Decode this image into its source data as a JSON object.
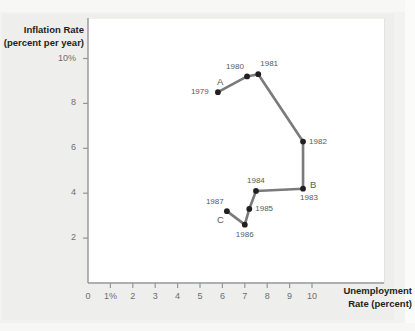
{
  "chart_data": {
    "type": "line",
    "title": "",
    "subtitle": "",
    "xlabel": "Unemployment Rate (percent)",
    "ylabel": "Inflation Rate (percent per year)",
    "xlabel_line1": "Unemployment",
    "xlabel_line2": "Rate (percent)",
    "ylabel_line1": "Inflation Rate",
    "ylabel_line2": "(percent per year)",
    "xlim": [
      0,
      10.6
    ],
    "ylim": [
      0,
      10.6
    ],
    "grid": false,
    "legend": "none",
    "xticks": [
      {
        "value": 0,
        "label": "0"
      },
      {
        "value": 1,
        "label": "1%"
      },
      {
        "value": 2,
        "label": "2"
      },
      {
        "value": 3,
        "label": "3"
      },
      {
        "value": 4,
        "label": "4"
      },
      {
        "value": 5,
        "label": "5"
      },
      {
        "value": 6,
        "label": "6"
      },
      {
        "value": 7,
        "label": "7"
      },
      {
        "value": 8,
        "label": "8"
      },
      {
        "value": 9,
        "label": "9"
      },
      {
        "value": 10,
        "label": "10"
      }
    ],
    "yticks": [
      {
        "value": 10,
        "label": "10%"
      },
      {
        "value": 8,
        "label": "8"
      },
      {
        "value": 6,
        "label": "6"
      },
      {
        "value": 4,
        "label": "4"
      },
      {
        "value": 2,
        "label": "2"
      }
    ],
    "series": [
      {
        "name": "Phillips curve path 1979-1987",
        "color": "#7a7a7c",
        "marker_color": "#231f20",
        "points": [
          {
            "year": "1979",
            "x": 5.8,
            "y": 8.5,
            "label": "1979",
            "label_pos": "left",
            "annotation": "A",
            "annotation_pos": "above"
          },
          {
            "year": "1980",
            "x": 7.1,
            "y": 9.2,
            "label": "1980",
            "label_pos": "above-left",
            "annotation": "",
            "annotation_pos": ""
          },
          {
            "year": "1981",
            "x": 7.6,
            "y": 9.3,
            "label": "1981",
            "label_pos": "above-right",
            "annotation": "",
            "annotation_pos": ""
          },
          {
            "year": "1982",
            "x": 9.6,
            "y": 6.3,
            "label": "1982",
            "label_pos": "right",
            "annotation": "",
            "annotation_pos": ""
          },
          {
            "year": "1983",
            "x": 9.6,
            "y": 4.2,
            "label": "1983",
            "label_pos": "below-right",
            "annotation": "B",
            "annotation_pos": "right"
          },
          {
            "year": "1984",
            "x": 7.5,
            "y": 4.1,
            "label": "1984",
            "label_pos": "above",
            "annotation": "",
            "annotation_pos": ""
          },
          {
            "year": "1985",
            "x": 7.2,
            "y": 3.3,
            "label": "1985",
            "label_pos": "right",
            "annotation": "",
            "annotation_pos": ""
          },
          {
            "year": "1986",
            "x": 7.0,
            "y": 2.6,
            "label": "1986",
            "label_pos": "below",
            "annotation": "",
            "annotation_pos": ""
          },
          {
            "year": "1987",
            "x": 6.2,
            "y": 3.2,
            "label": "1987",
            "label_pos": "above-left",
            "annotation": "C",
            "annotation_pos": "below-left"
          }
        ]
      }
    ],
    "colors": {
      "line": "#7a7a7c",
      "marker": "#231f20",
      "axis": "#939598",
      "tick_text": "#6d6e71",
      "title_text": "#231f20",
      "plot_background": "#ffffff",
      "page_background": "#f2f2f1"
    }
  }
}
